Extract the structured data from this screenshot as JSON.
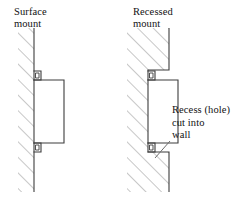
{
  "figure": {
    "type": "technical-line-diagram",
    "background_color": "#ffffff",
    "line_color": "#3d3d3d",
    "hatch_color": "#8a8a8a",
    "panels": [
      {
        "id": "surface-mount",
        "title": "Surface\nmount",
        "title_line_1": "Surface",
        "title_line_2": "mount",
        "wall": {
          "name": "wall-hatched",
          "hatching": "diagonal",
          "thickness_px": 16,
          "face_x": 34
        },
        "device": {
          "name": "mounted-unit",
          "position": "in front of wall face",
          "clips": 2
        }
      },
      {
        "id": "recessed-mount",
        "title": "Recessed\nmount",
        "title_line_1": "Recessed",
        "title_line_2": "mount",
        "wall": {
          "name": "wall-hatched-recessed",
          "hatching": "diagonal",
          "thickness_px": 42,
          "face_x": 165
        },
        "device": {
          "name": "mounted-unit",
          "position": "set into recess in wall",
          "clips": 2
        },
        "annotation": {
          "text": "Recess (hole)\ncut into\nwall",
          "line_1": "Recess (hole)",
          "line_2": "cut into",
          "line_3": "wall",
          "leader": "line from text to recess opening"
        }
      }
    ]
  }
}
